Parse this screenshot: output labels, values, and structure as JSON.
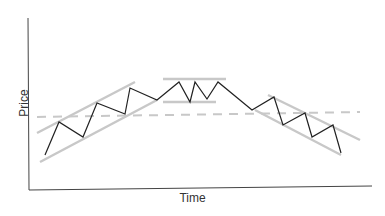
{
  "chart_data": {
    "type": "line",
    "title": "",
    "xlabel": "Time",
    "ylabel": "Price",
    "grid": false,
    "legend": null,
    "annotations": [
      {
        "type": "ascending-channel",
        "upper": [
          [
            37,
            133
          ],
          [
            135,
            82
          ]
        ],
        "lower": [
          [
            40,
            162
          ],
          [
            157,
            100
          ]
        ]
      },
      {
        "type": "rectangle-range",
        "upper": [
          [
            163,
            79
          ],
          [
            226,
            79
          ]
        ],
        "lower": [
          [
            163,
            102
          ],
          [
            216,
            102
          ]
        ]
      },
      {
        "type": "descending-channel",
        "upper": [
          [
            268,
            95
          ],
          [
            360,
            140
          ]
        ],
        "lower": [
          [
            255,
            110
          ],
          [
            341,
            155
          ]
        ]
      },
      {
        "type": "dashed-level",
        "line": [
          [
            37,
            117
          ],
          [
            360,
            112
          ]
        ]
      }
    ],
    "series": [
      {
        "name": "price",
        "points": [
          [
            45,
            155
          ],
          [
            59,
            122
          ],
          [
            83,
            137
          ],
          [
            97,
            103
          ],
          [
            125,
            114
          ],
          [
            130,
            88
          ],
          [
            157,
            100
          ],
          [
            179,
            82
          ],
          [
            190,
            102
          ],
          [
            195,
            82
          ],
          [
            207,
            99
          ],
          [
            218,
            82
          ],
          [
            252,
            110
          ],
          [
            274,
            97
          ],
          [
            283,
            125
          ],
          [
            305,
            113
          ],
          [
            312,
            137
          ],
          [
            333,
            125
          ],
          [
            341,
            153
          ]
        ]
      }
    ]
  },
  "colors": {
    "price_line": "#222222",
    "guide_line": "#c8c8c8",
    "axis": "#444444"
  }
}
